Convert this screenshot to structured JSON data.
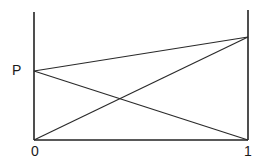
{
  "diagram": {
    "type": "line-diagram",
    "labels": {
      "p": "P",
      "zero": "0",
      "one": "1"
    },
    "points": {
      "origin": {
        "name": "O",
        "axis": "left",
        "position": "bottom"
      },
      "P": {
        "name": "P",
        "axis": "left",
        "position": "middle"
      },
      "right_top": {
        "axis": "right",
        "position": "upper"
      },
      "right_bottom": {
        "axis": "right",
        "position": "bottom"
      }
    },
    "segments": [
      {
        "from": "P",
        "to": "right_top"
      },
      {
        "from": "P",
        "to": "right_bottom"
      },
      {
        "from": "origin",
        "to": "right_top"
      },
      {
        "from": "origin",
        "to": "right_bottom"
      }
    ],
    "colors": {
      "line": "#222222",
      "background": "#ffffff"
    }
  }
}
